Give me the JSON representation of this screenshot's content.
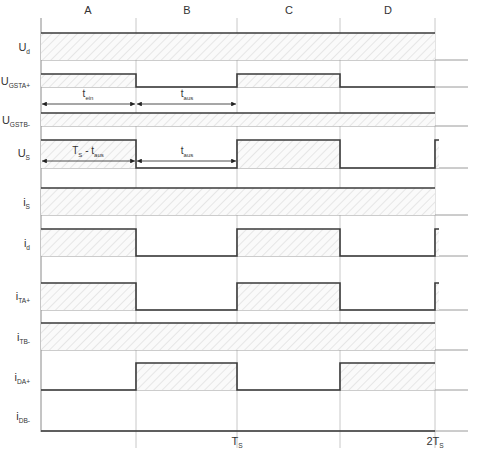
{
  "diagram": {
    "type": "timing-diagram",
    "x_axis": {
      "left": 41,
      "boundaries": [
        136,
        237,
        340,
        435
      ],
      "end": 468,
      "labels": [
        {
          "text": "T",
          "sub": "S",
          "x": 237
        },
        {
          "text": "2T",
          "sub": "S",
          "x": 435
        }
      ]
    },
    "columns": [
      {
        "label": "A",
        "x": 88
      },
      {
        "label": "B",
        "x": 187
      },
      {
        "label": "C",
        "x": 289
      },
      {
        "label": "D",
        "x": 388
      }
    ],
    "rows": [
      {
        "name": "U",
        "sub": "d",
        "label_y": 47,
        "top": 33,
        "base": 60,
        "segments": [
          [
            41,
            435,
            "high"
          ]
        ],
        "tail": false
      },
      {
        "name": "U",
        "sub": "GSTA+",
        "label_y": 81,
        "top": 74,
        "base": 87,
        "segments": [
          [
            41,
            136,
            "high"
          ],
          [
            136,
            237,
            "low"
          ],
          [
            237,
            340,
            "high"
          ],
          [
            340,
            435,
            "low"
          ]
        ],
        "tail": false
      },
      {
        "name": "U",
        "sub": "GSTB-",
        "label_y": 120,
        "top": 113,
        "base": 126,
        "segments": [
          [
            41,
            435,
            "high"
          ]
        ],
        "tail": false
      },
      {
        "name": "U",
        "sub": "S",
        "label_y": 153,
        "top": 140,
        "base": 168,
        "segments": [
          [
            41,
            136,
            "high"
          ],
          [
            136,
            237,
            "low"
          ],
          [
            237,
            340,
            "high"
          ],
          [
            340,
            435,
            "low"
          ]
        ],
        "tail": true
      },
      {
        "name": "i",
        "sub": "S",
        "label_y": 202,
        "top": 188,
        "base": 215,
        "segments": [
          [
            41,
            435,
            "high"
          ]
        ],
        "tail": false
      },
      {
        "name": "i",
        "sub": "d",
        "label_y": 243,
        "top": 229,
        "base": 256,
        "segments": [
          [
            41,
            136,
            "high"
          ],
          [
            136,
            237,
            "low"
          ],
          [
            237,
            340,
            "high"
          ],
          [
            340,
            435,
            "low"
          ]
        ],
        "tail": true
      },
      {
        "name": "i",
        "sub": "TA+",
        "label_y": 296,
        "top": 283,
        "base": 310,
        "segments": [
          [
            41,
            136,
            "high"
          ],
          [
            136,
            237,
            "low"
          ],
          [
            237,
            340,
            "high"
          ],
          [
            340,
            435,
            "low"
          ]
        ],
        "tail": true
      },
      {
        "name": "i",
        "sub": "TB-",
        "label_y": 337,
        "top": 323,
        "base": 350,
        "segments": [
          [
            41,
            435,
            "high"
          ]
        ],
        "tail": false
      },
      {
        "name": "i",
        "sub": "DA+",
        "label_y": 377,
        "top": 363,
        "base": 390,
        "segments": [
          [
            41,
            136,
            "low"
          ],
          [
            136,
            237,
            "high"
          ],
          [
            237,
            340,
            "low"
          ],
          [
            340,
            435,
            "high"
          ]
        ],
        "tail": false
      },
      {
        "name": "i",
        "sub": "DB-",
        "label_y": 416,
        "top": 431,
        "base": 431,
        "segments": [
          [
            41,
            435,
            "low"
          ]
        ],
        "tail": false
      }
    ],
    "annotations": [
      {
        "label": "t",
        "sub": "ein",
        "x1": 41,
        "x2": 136,
        "y": 104,
        "text_x": 88,
        "text_y": 97
      },
      {
        "label": "t",
        "sub": "aus",
        "x1": 136,
        "x2": 237,
        "y": 104,
        "text_x": 187,
        "text_y": 97
      },
      {
        "label": "T",
        "sub": "S",
        "suffix": " - t",
        "suffix_sub": "aus",
        "x1": 41,
        "x2": 136,
        "y": 161,
        "text_x": 88,
        "text_y": 154
      },
      {
        "label": "t",
        "sub": "aus",
        "x1": 136,
        "x2": 237,
        "y": 161,
        "text_x": 187,
        "text_y": 154
      }
    ],
    "colors": {
      "signal": "#3a3a3a",
      "baseline": "#9a9a9a",
      "gridline": "#c8c8c8",
      "hatch": "#cfcfcf",
      "text": "#333333"
    }
  }
}
